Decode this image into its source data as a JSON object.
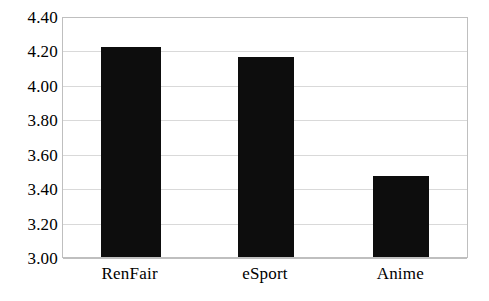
{
  "chart_data": {
    "type": "bar",
    "title": "",
    "subtitle": "",
    "xlabel": "",
    "ylabel": "",
    "categories": [
      "RenFair",
      "eSport",
      "Anime"
    ],
    "values": [
      4.22,
      4.16,
      3.47
    ],
    "series": [
      {
        "name": "",
        "values": [
          4.22,
          4.16,
          3.47
        ]
      }
    ],
    "ylim": [
      3.0,
      4.4
    ],
    "ytick_step": 0.2,
    "ytick_labels": [
      "4.40",
      "4.20",
      "4.00",
      "3.80",
      "3.60",
      "3.40",
      "3.20",
      "3.00"
    ],
    "ytick_values": [
      4.4,
      4.2,
      4.0,
      3.8,
      3.6,
      3.4,
      3.2,
      3.0
    ],
    "grid": true,
    "grid_axis": "y",
    "legend": false,
    "legend_position": "none",
    "annotations": [],
    "bar_color": "#0d0d0d",
    "gridline_color": "#d9d9d9",
    "plot_border_color": "#bfbfbf",
    "background_color": "#ffffff"
  }
}
